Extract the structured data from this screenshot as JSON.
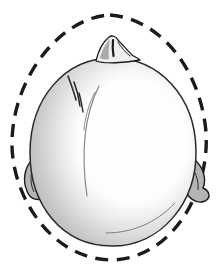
{
  "figure": {
    "palette": {
      "background": "#ffffff",
      "ink": "#1b1b1b",
      "outline_thin": "#2a2a2a",
      "shade_mid": "#c2c4c3",
      "shade_dark": "#a7a9a8",
      "ear_fill": "#b3b5b4",
      "nose_fill": "#f0f0ef",
      "nose_shadow": "#979998",
      "contour_gray": "#7d7f7e",
      "highlight": "#ffffff"
    },
    "normal_outline": {
      "path": "M 110 15 C 162 19 201 72 206 132 C 210 192 172 259 111 260 C 52 259 13 198 12 146 C 11 78 61 17 110 15 Z",
      "stroke_width": "3.4",
      "dash_array": "13 8.5"
    },
    "head": {
      "path": "M 112 58 C 159 58 195 96 196 150 C 197 203 161 246 112 246 C 62 246 30 205 30 153 C 30 98 65 58 112 58 Z",
      "stroke_width": "1.5"
    },
    "left_ear": {
      "path": "M 50 150 C 38 145 30 150 32 160 C 25 167 22 180 27 191 C 30 200 40 202 44 196 C 40 186 42 174 48 168 Z",
      "inner_path": "M 34 164 C 30 174 30 184 34 192"
    },
    "right_ear": {
      "path": "M 178 150 C 188 146 196 151 195 160 C 203 167 207 179 203 188 C 210 191 211 198 205 201 C 196 205 186 197 184 186 C 179 175 176 161 178 150 Z",
      "inner_path": "M 188 162 C 195 170 199 180 198 190"
    },
    "nose": {
      "outer_path": "M 96 61 C 98 52 103 42 109 37 C 112 35 116 36 118 40 C 122 44 127 50 132 55 C 135 57 138 58 140 60 C 126 63 104 64 96 61 Z",
      "shadow_path": "M 100 58 C 102 50 106 43 110 39 C 109 47 108 54 109 59 C 105 60 101 59 100 58 Z",
      "median_path": "M 113 40 C 112.5 45 112.5 50 113.5 56",
      "wing_path": "M 118 42 C 121 47 125 52 130 56"
    },
    "contours": {
      "left_crescent": "M 99 86 C 86 112 80 148 87 196",
      "left_crescent_short": "M 95 92 C 88 106 85 118 84 130",
      "bottom_arc": "M 106 233 C 132 233 156 223 175 203",
      "hatch_1": "M 68 76 C 71 84 74 92 76 100",
      "hatch_2": "M 74 82 C 77 90 79 98 80 106",
      "hatch_3": "M 79 93 C 81 100 82 106 83 112"
    }
  }
}
